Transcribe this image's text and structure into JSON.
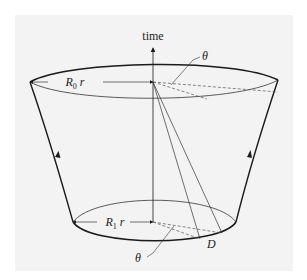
{
  "figure": {
    "axis_label": "time",
    "top_radius_label": {
      "main": "R",
      "sub": "0",
      "suffix": " r"
    },
    "bottom_radius_label": {
      "main": "R",
      "sub": "1",
      "suffix": " r"
    },
    "top_angle_label": "θ",
    "bottom_angle_label": "θ",
    "point_label": "D"
  },
  "colors": {
    "background": "#f3f3f3",
    "stroke": "#1a1a1a",
    "thin_stroke": "#444444"
  }
}
